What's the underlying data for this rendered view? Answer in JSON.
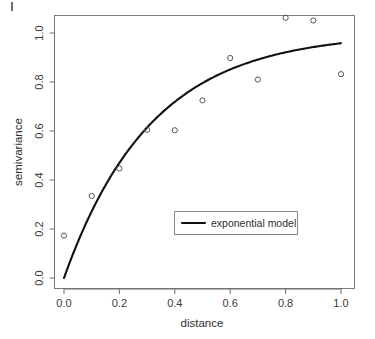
{
  "chart_data": {
    "type": "scatter",
    "title": "",
    "subtitle": "",
    "xlabel": "distance",
    "ylabel": "semivariance",
    "xlim": [
      -0.035,
      1.06
    ],
    "ylim": [
      -0.045,
      1.12
    ],
    "xticks": [
      0.0,
      0.2,
      0.4,
      0.6,
      0.8,
      1.0
    ],
    "xtick_labels": [
      "0.0",
      "0.2",
      "0.4",
      "0.6",
      "0.8",
      "1.0"
    ],
    "yticks": [
      0.0,
      0.2,
      0.4,
      0.6,
      0.8,
      1.0
    ],
    "ytick_labels": [
      "0.0",
      "0.2",
      "0.4",
      "0.6",
      "0.8",
      "1.0"
    ],
    "grid": false,
    "marker": "open-circle",
    "legend_position": "center-right-inside",
    "series": [
      {
        "name": "empirical semivariance",
        "type": "scatter",
        "marker": "open-circle",
        "color": "#555555",
        "x": [
          0.0,
          0.1,
          0.2,
          0.3,
          0.4,
          0.5,
          0.6,
          0.7,
          0.8,
          0.9,
          1.0
        ],
        "y": [
          0.173,
          0.335,
          0.447,
          0.605,
          0.603,
          0.725,
          0.898,
          0.81,
          1.062,
          1.051,
          0.832
        ]
      },
      {
        "name": "exponential model",
        "type": "line",
        "color": "#111111",
        "model": "sill * (1 - exp(-distance / range))",
        "sill": 1.0,
        "range": 0.315,
        "x": [
          0.0,
          0.05,
          0.1,
          0.15,
          0.2,
          0.25,
          0.3,
          0.35,
          0.4,
          0.45,
          0.5,
          0.55,
          0.6,
          0.65,
          0.7,
          0.75,
          0.8,
          0.85,
          0.9,
          0.95,
          1.0
        ],
        "y": [
          0.0,
          0.146,
          0.271,
          0.379,
          0.469,
          0.548,
          0.614,
          0.671,
          0.719,
          0.76,
          0.795,
          0.825,
          0.85,
          0.872,
          0.89,
          0.906,
          0.92,
          0.931,
          0.941,
          0.95,
          0.957
        ]
      }
    ],
    "legend": [
      {
        "label": "exponential model",
        "marker": "line",
        "color": "#111111"
      }
    ]
  },
  "figure": {
    "axis_color": "#6e6e6e",
    "marker_color": "#555555",
    "curve_color": "#111111",
    "background": "#ffffff"
  }
}
